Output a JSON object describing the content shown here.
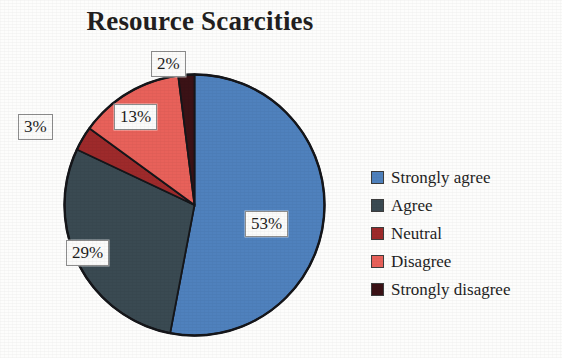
{
  "chart_data": {
    "type": "pie",
    "title": "Resource Scarcities",
    "xlabel": "",
    "ylabel": "",
    "legend_position": "right",
    "grid": false,
    "categories": [
      "Strongly agree",
      "Agree",
      "Neutral",
      "Disagree",
      "Strongly disagree"
    ],
    "values": [
      53,
      29,
      3,
      13,
      2
    ],
    "value_labels": [
      "53%",
      "29%",
      "3%",
      "13%",
      "2%"
    ],
    "colors": [
      "#4F81BD",
      "#3A4A52",
      "#9E2A2B",
      "#E8615A",
      "#3B1216"
    ],
    "start_angle_deg": 0,
    "direction": "clockwise",
    "units": "percent",
    "slices": [
      {
        "name": "Strongly agree",
        "value": 53,
        "label": "53%",
        "color": "#4F81BD"
      },
      {
        "name": "Agree",
        "value": 29,
        "label": "29%",
        "color": "#3A4A52"
      },
      {
        "name": "Neutral",
        "value": 3,
        "label": "3%",
        "color": "#9E2A2B"
      },
      {
        "name": "Disagree",
        "value": 13,
        "label": "13%",
        "color": "#E8615A"
      },
      {
        "name": "Strongly disagree",
        "value": 2,
        "label": "2%",
        "color": "#3B1216"
      }
    ]
  },
  "title": "Resource Scarcities",
  "labels": {
    "strongly_agree": "53%",
    "agree": "29%",
    "neutral": "3%",
    "disagree": "13%",
    "strongly_disagree": "2%"
  },
  "legend": {
    "items": [
      {
        "label": "Strongly agree",
        "color": "#4F81BD"
      },
      {
        "label": "Agree",
        "color": "#3A4A52"
      },
      {
        "label": "Neutral",
        "color": "#9E2A2B"
      },
      {
        "label": "Disagree",
        "color": "#E8615A"
      },
      {
        "label": "Strongly disagree",
        "color": "#3B1216"
      }
    ]
  },
  "style": {
    "outline_color": "#15161a",
    "label_border": "#8d8d8d",
    "background": "#fdfdfc"
  }
}
